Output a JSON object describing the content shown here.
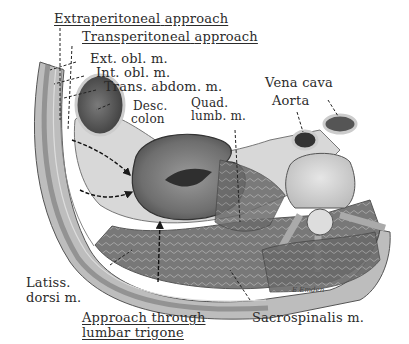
{
  "figure": {
    "signature": "E.Emden"
  },
  "approaches": [
    {
      "label_a": "Extraperitoneal",
      "label_b": "approach"
    },
    {
      "label_a": "Transperitoneal",
      "label_b": "approach"
    },
    {
      "label_a": "Approach through",
      "label_b": "lumbar trigone"
    }
  ],
  "labels": {
    "ext_obl": "Ext. obl. m.",
    "int_obl": "Int. obl. m.",
    "trans_abdom": "Trans. abdom. m.",
    "desc": "Desc.",
    "colon": "colon",
    "quad": "Quad.",
    "lumb": "lumb. m.",
    "vena_cava": "Vena cava",
    "aorta": "Aorta",
    "latiss": "Latiss.",
    "dorsi": "dorsi m.",
    "sacrospinalis": "Sacrospinalis m."
  },
  "colors": {
    "ink": "#2b2b2b",
    "tissue_dark": "#5a5a5a",
    "tissue_mid": "#8c8c8c",
    "tissue_light": "#c9c9c9",
    "background": "#ffffff"
  }
}
